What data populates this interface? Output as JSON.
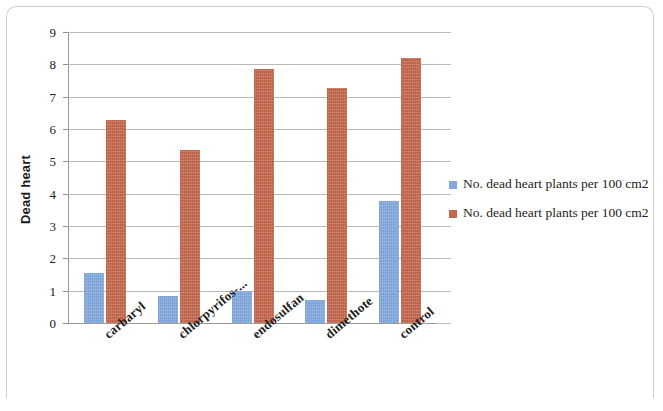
{
  "chart_data": {
    "type": "bar",
    "title": "",
    "xlabel": "",
    "ylabel": "Dead heart",
    "ylim": [
      0,
      9
    ],
    "ytick_labels": [
      "0",
      "1",
      "2",
      "3",
      "4",
      "5",
      "6",
      "7",
      "8",
      "9"
    ],
    "yticks": [
      0,
      1,
      2,
      3,
      4,
      5,
      6,
      7,
      8,
      9
    ],
    "grid": true,
    "legend_position": "right",
    "categories": [
      "carbaryl",
      "chlorpyrifos-...",
      "endosulfan",
      "dimethote",
      "control"
    ],
    "series": [
      {
        "name": "No. dead heart plants per 100 cm2",
        "color": "#82a9dd",
        "values": [
          1.55,
          0.85,
          0.98,
          0.72,
          3.78
        ]
      },
      {
        "name": "No. dead heart plants per 100 cm2",
        "color": "#c4674c",
        "values": [
          6.28,
          5.35,
          7.85,
          7.28,
          8.2
        ]
      }
    ]
  },
  "chart": {
    "y_axis_title": "Dead heart"
  },
  "legend": {
    "entries": [
      {
        "label": "No. dead heart plants per 100 cm2",
        "color": "#82a9dd"
      },
      {
        "label": "No. dead heart plants per 100 cm2",
        "color": "#c4674c"
      }
    ]
  }
}
